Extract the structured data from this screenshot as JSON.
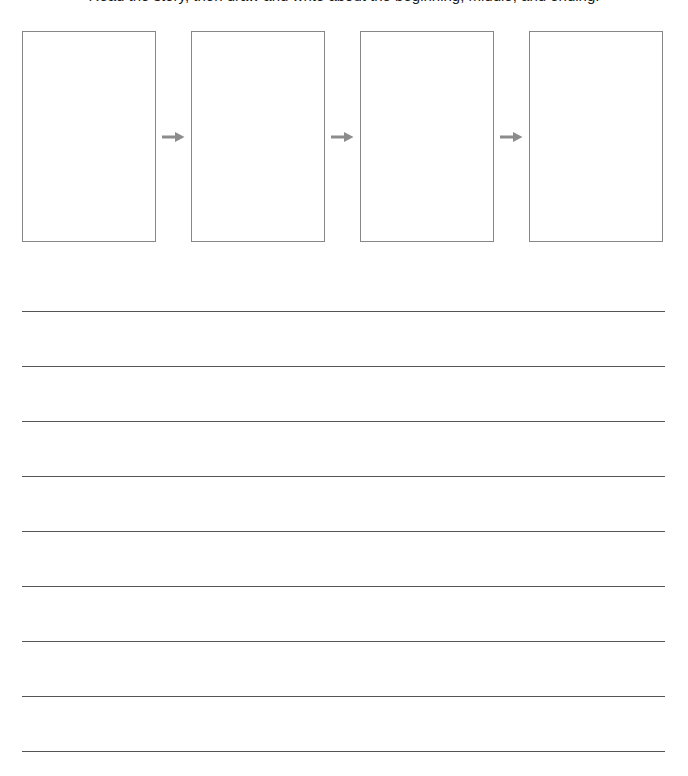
{
  "page": {
    "title_partial": "Read the story, then draw and write about the beginning, middle, and ending.",
    "background_color": "#ffffff"
  },
  "sequence_strip": {
    "box_border_color": "#878787",
    "arrow_color": "#8c8c8c",
    "boxes": [
      {
        "label": "",
        "name": "sequence-box-1"
      },
      {
        "label": "",
        "name": "sequence-box-2"
      },
      {
        "label": "",
        "name": "sequence-box-3"
      },
      {
        "label": "",
        "name": "sequence-box-4"
      }
    ],
    "arrows": [
      {
        "icon": "arrow-right-icon"
      },
      {
        "icon": "arrow-right-icon"
      },
      {
        "icon": "arrow-right-icon"
      }
    ]
  },
  "writing_area": {
    "line_color": "#555555",
    "line_count": 9,
    "lines": [
      {
        "value": ""
      },
      {
        "value": ""
      },
      {
        "value": ""
      },
      {
        "value": ""
      },
      {
        "value": ""
      },
      {
        "value": ""
      },
      {
        "value": ""
      },
      {
        "value": ""
      },
      {
        "value": ""
      }
    ]
  }
}
